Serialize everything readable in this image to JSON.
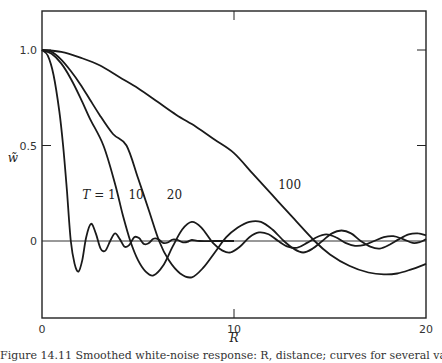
{
  "chart_data": {
    "type": "line",
    "title": "",
    "xlabel": "R",
    "ylabel": "w̃",
    "xlim": [
      0,
      20
    ],
    "ylim": [
      -0.4,
      1.2
    ],
    "x_ticks": [
      0,
      10,
      20
    ],
    "x_tick_labels": [
      "0",
      "10",
      "20"
    ],
    "y_ticks": [
      0,
      0.5,
      1.0
    ],
    "y_tick_labels": [
      "0",
      "0.5",
      "1.0"
    ],
    "grid": false,
    "zero_line": true,
    "legend": "inline labels",
    "annotations": [
      {
        "text": "T = 1",
        "x": 2.1,
        "y": 0.22
      },
      {
        "text": "10",
        "x": 4.5,
        "y": 0.22
      },
      {
        "text": "20",
        "x": 6.5,
        "y": 0.22
      },
      {
        "text": "100",
        "x": 12.3,
        "y": 0.27
      }
    ],
    "series": [
      {
        "name": "T = 1",
        "points": [
          [
            0,
            1
          ],
          [
            0.3,
            0.97
          ],
          [
            0.6,
            0.87
          ],
          [
            0.9,
            0.68
          ],
          [
            1.1,
            0.5
          ],
          [
            1.3,
            0.26
          ],
          [
            1.5,
            0.0
          ],
          [
            1.7,
            -0.12
          ],
          [
            1.9,
            -0.16
          ],
          [
            2.1,
            -0.1
          ],
          [
            2.3,
            0.02
          ],
          [
            2.55,
            0.09
          ],
          [
            2.8,
            0.04
          ],
          [
            3.05,
            -0.04
          ],
          [
            3.3,
            -0.05
          ],
          [
            3.55,
            0.0
          ],
          [
            3.8,
            0.04
          ],
          [
            4.05,
            0.01
          ],
          [
            4.3,
            -0.03
          ],
          [
            4.55,
            -0.02
          ],
          [
            4.8,
            0.02
          ],
          [
            5.05,
            0.015
          ],
          [
            5.3,
            -0.015
          ],
          [
            5.55,
            -0.012
          ],
          [
            5.8,
            0.012
          ],
          [
            6.05,
            0.01
          ],
          [
            6.3,
            -0.01
          ],
          [
            6.55,
            -0.008
          ],
          [
            6.8,
            0.008
          ],
          [
            7.05,
            0.006
          ],
          [
            7.3,
            -0.006
          ],
          [
            7.55,
            -0.005
          ],
          [
            7.8,
            0.005
          ],
          [
            8.2,
            0.0
          ],
          [
            9,
            0
          ],
          [
            10,
            0
          ]
        ]
      },
      {
        "name": "T = 10",
        "points": [
          [
            0,
            1
          ],
          [
            0.5,
            0.98
          ],
          [
            1,
            0.93
          ],
          [
            1.5,
            0.85
          ],
          [
            2,
            0.75
          ],
          [
            2.5,
            0.64
          ],
          [
            3.2,
            0.5
          ],
          [
            3.8,
            0.3
          ],
          [
            4.2,
            0.14
          ],
          [
            4.6,
            0.0
          ],
          [
            5.0,
            -0.1
          ],
          [
            5.4,
            -0.16
          ],
          [
            5.8,
            -0.18
          ],
          [
            6.3,
            -0.13
          ],
          [
            6.8,
            -0.03
          ],
          [
            7.3,
            0.06
          ],
          [
            7.8,
            0.1
          ],
          [
            8.3,
            0.07
          ],
          [
            8.9,
            -0.01
          ],
          [
            9.4,
            -0.05
          ],
          [
            9.8,
            -0.06
          ],
          [
            10.3,
            -0.03
          ],
          [
            10.8,
            0.02
          ],
          [
            11.3,
            0.045
          ],
          [
            11.8,
            0.035
          ],
          [
            12.3,
            0.0
          ],
          [
            12.8,
            -0.03
          ],
          [
            13.3,
            -0.035
          ],
          [
            13.8,
            -0.01
          ],
          [
            14.3,
            0.02
          ],
          [
            14.8,
            0.035
          ],
          [
            15.3,
            0.02
          ],
          [
            15.8,
            -0.01
          ],
          [
            16.3,
            -0.025
          ],
          [
            16.8,
            -0.02
          ],
          [
            17.3,
            0.0
          ],
          [
            17.8,
            0.02
          ],
          [
            18.3,
            0.025
          ],
          [
            18.8,
            0.01
          ],
          [
            19.3,
            -0.01
          ],
          [
            19.7,
            -0.005
          ],
          [
            20,
            0.01
          ]
        ]
      },
      {
        "name": "T = 20",
        "points": [
          [
            0,
            1
          ],
          [
            0.5,
            0.99
          ],
          [
            1,
            0.95
          ],
          [
            1.5,
            0.89
          ],
          [
            2,
            0.82
          ],
          [
            2.5,
            0.74
          ],
          [
            3,
            0.66
          ],
          [
            3.7,
            0.56
          ],
          [
            4.4,
            0.5
          ],
          [
            5.0,
            0.33
          ],
          [
            5.6,
            0.15
          ],
          [
            6.1,
            0.0
          ],
          [
            6.6,
            -0.1
          ],
          [
            7.2,
            -0.17
          ],
          [
            7.8,
            -0.19
          ],
          [
            8.4,
            -0.14
          ],
          [
            9.0,
            -0.06
          ],
          [
            9.6,
            0.02
          ],
          [
            10.2,
            0.07
          ],
          [
            10.8,
            0.1
          ],
          [
            11.4,
            0.1
          ],
          [
            12.0,
            0.06
          ],
          [
            12.6,
            0.0
          ],
          [
            13.1,
            -0.04
          ],
          [
            13.6,
            -0.06
          ],
          [
            14.1,
            -0.04
          ],
          [
            14.6,
            0.0
          ],
          [
            15.1,
            0.04
          ],
          [
            15.6,
            0.055
          ],
          [
            16.1,
            0.04
          ],
          [
            16.6,
            0.0
          ],
          [
            17.1,
            -0.03
          ],
          [
            17.6,
            -0.04
          ],
          [
            18.1,
            -0.02
          ],
          [
            18.6,
            0.01
          ],
          [
            19.1,
            0.035
          ],
          [
            19.6,
            0.04
          ],
          [
            20,
            0.03
          ]
        ]
      },
      {
        "name": "T = 100",
        "points": [
          [
            0,
            1
          ],
          [
            1,
            0.99
          ],
          [
            2,
            0.96
          ],
          [
            3,
            0.92
          ],
          [
            4,
            0.86
          ],
          [
            5,
            0.8
          ],
          [
            6,
            0.73
          ],
          [
            7,
            0.66
          ],
          [
            8,
            0.6
          ],
          [
            9,
            0.53
          ],
          [
            10,
            0.46
          ],
          [
            11,
            0.35
          ],
          [
            12,
            0.24
          ],
          [
            13,
            0.13
          ],
          [
            14.2,
            0.0
          ],
          [
            15,
            -0.07
          ],
          [
            16,
            -0.13
          ],
          [
            17,
            -0.165
          ],
          [
            17.8,
            -0.175
          ],
          [
            18.5,
            -0.17
          ],
          [
            19.2,
            -0.15
          ],
          [
            20,
            -0.12
          ]
        ]
      }
    ]
  },
  "caption_text": "Figure 14.11  Smoothed white-noise response: R, distance; curves for several values of T (partially cut off)"
}
